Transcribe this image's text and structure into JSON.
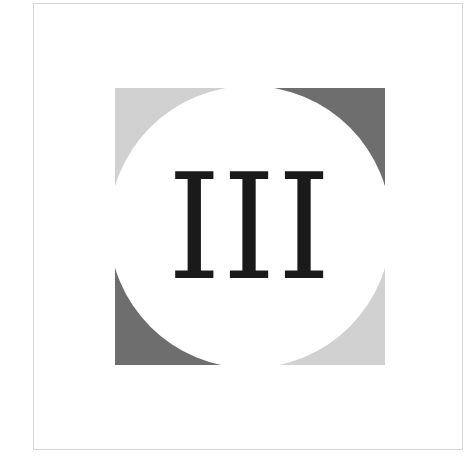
{
  "logo": {
    "text": "III",
    "colors": {
      "light_gray": "#d1d1d1",
      "dark_gray": "#6e6e6e",
      "circle": "#ffffff",
      "text": "#1a1a1a",
      "frame_border": "#d6d6d6"
    },
    "quadrants": [
      {
        "position": "top-left",
        "shade": "light"
      },
      {
        "position": "top-right",
        "shade": "dark"
      },
      {
        "position": "bottom-left",
        "shade": "dark"
      },
      {
        "position": "bottom-right",
        "shade": "light"
      }
    ]
  }
}
